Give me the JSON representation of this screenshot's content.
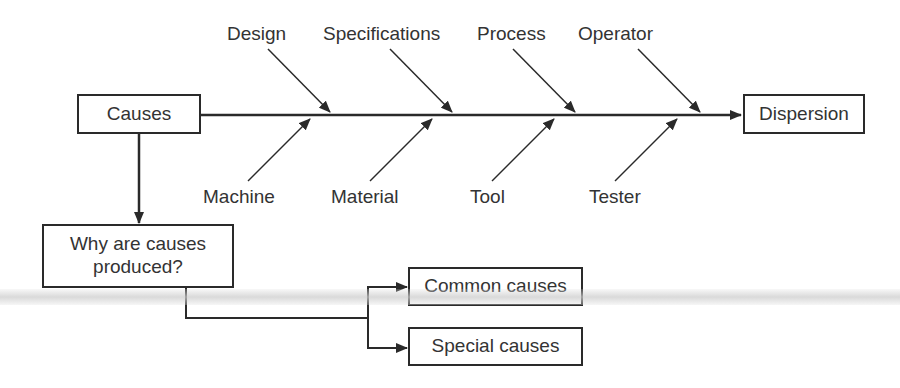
{
  "diagram": {
    "type": "cause-and-effect (fishbone) diagram",
    "source_box": "Causes",
    "effect_box": "Dispersion",
    "top_branches": [
      "Design",
      "Specifications",
      "Process",
      "Operator"
    ],
    "bottom_branches": [
      "Machine",
      "Material",
      "Tool",
      "Tester"
    ],
    "question_box": "Why are causes produced?",
    "question_box_lines": [
      "Why are causes",
      "produced?"
    ],
    "outcome_boxes": [
      "Common causes",
      "Special causes"
    ]
  },
  "colors": {
    "line": "#2a2a2a",
    "text": "#333333",
    "background": "#ffffff",
    "scan_artifact": "#d0d0d0"
  }
}
